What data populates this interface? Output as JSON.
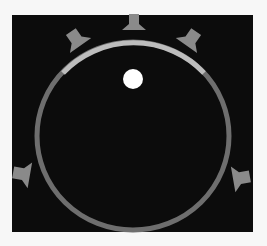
{
  "game": {
    "title": "Circular arena",
    "colors": {
      "background": "#f7f7f7",
      "panel": "#0c0c0c",
      "ring": "#6e6e6e",
      "ring_highlight": "#bdbdbd",
      "bumper": "#8a8a8a",
      "ball": "#ffffff"
    },
    "arena": {
      "cx": 133,
      "cy": 136,
      "rx": 96,
      "ry": 94,
      "stroke_width": 5
    },
    "highlight_arc": {
      "start": [
        63,
        73
      ],
      "end": [
        204,
        73
      ]
    },
    "ball": {
      "cx": 133,
      "cy": 79,
      "r": 10
    },
    "bumpers": [
      {
        "name": "top",
        "x": 134,
        "y": 22,
        "angle": 0
      },
      {
        "name": "upper-left",
        "x": 78,
        "y": 38,
        "angle": -40
      },
      {
        "name": "upper-right",
        "x": 190,
        "y": 38,
        "angle": 40
      },
      {
        "name": "left",
        "x": 20,
        "y": 174,
        "angle": -90
      },
      {
        "name": "right",
        "x": 242,
        "y": 178,
        "angle": 90
      }
    ]
  }
}
